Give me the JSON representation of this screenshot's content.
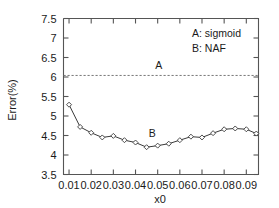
{
  "chart_data": {
    "type": "line",
    "title": "",
    "xlabel": "x0",
    "ylabel": "Error(%)",
    "xlim": [
      0.0075,
      0.0955
    ],
    "ylim": [
      3.5,
      7.5
    ],
    "grid": false,
    "legend_position": "top-right",
    "xticks": [
      0.01,
      0.02,
      0.03,
      0.04,
      0.05,
      0.06,
      0.07,
      0.08,
      0.09
    ],
    "xtick_labels": [
      "0.01",
      "0.02",
      "0.03",
      "0.04",
      "0.05",
      "0.06",
      "0.07",
      "0.08",
      "0.09"
    ],
    "yticks": [
      3.5,
      4,
      4.5,
      5,
      5.5,
      6,
      6.5,
      7,
      7.5
    ],
    "ytick_labels": [
      "3.5",
      "4",
      "4.5",
      "5",
      "5.5",
      "6",
      "6.5",
      "7",
      "7.5"
    ],
    "legend": [
      {
        "key": "A",
        "label": "A: sigmoid"
      },
      {
        "key": "B",
        "label": "B: NAF"
      }
    ],
    "annotations": [
      {
        "text": "A",
        "x": 0.0505,
        "y": 6.2
      },
      {
        "text": "B",
        "x": 0.0475,
        "y": 4.45
      }
    ],
    "series": [
      {
        "name": "A: sigmoid",
        "style": "dashed-horizontal",
        "marker": "none",
        "constant_y": 6.04,
        "x": [
          0.0075,
          0.0955
        ],
        "values": [
          6.04,
          6.04
        ]
      },
      {
        "name": "B: NAF",
        "style": "solid",
        "marker": "diamond",
        "x": [
          0.01,
          0.015,
          0.02,
          0.025,
          0.03,
          0.035,
          0.04,
          0.045,
          0.05,
          0.055,
          0.06,
          0.065,
          0.07,
          0.075,
          0.08,
          0.085,
          0.09,
          0.0945
        ],
        "values": [
          5.29,
          4.72,
          4.57,
          4.45,
          4.49,
          4.38,
          4.32,
          4.2,
          4.24,
          4.29,
          4.38,
          4.47,
          4.45,
          4.56,
          4.66,
          4.68,
          4.66,
          4.55
        ]
      }
    ]
  }
}
